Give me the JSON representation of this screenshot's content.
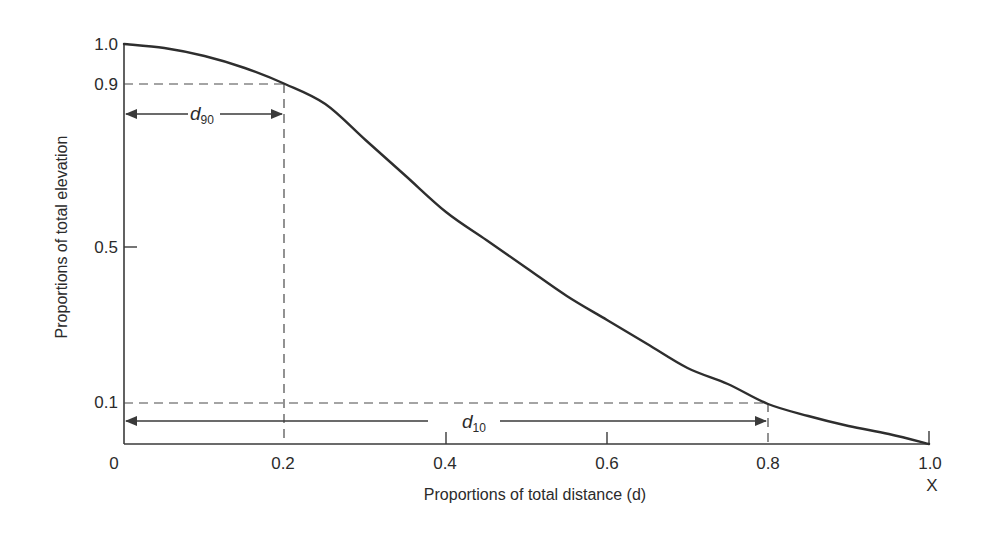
{
  "chart_data": {
    "type": "line",
    "title": "",
    "xlabel": "Proportions of total distance (d)",
    "ylabel": "Proportions of total elevation",
    "x_end_label": "X",
    "xlim": [
      0,
      1.0
    ],
    "ylim": [
      0,
      1.0
    ],
    "grid": false,
    "legend": "none",
    "x_ticks": [
      "0",
      "0.2",
      "0.4",
      "0.6",
      "0.8",
      "1.0"
    ],
    "y_ticks": [
      "1.0",
      "0.9",
      "0.5",
      "0.1"
    ],
    "series": [
      {
        "name": "hypsometric curve",
        "x": [
          0.0,
          0.05,
          0.1,
          0.15,
          0.2,
          0.25,
          0.3,
          0.35,
          0.4,
          0.45,
          0.5,
          0.55,
          0.6,
          0.65,
          0.7,
          0.75,
          0.8,
          0.85,
          0.9,
          0.95,
          1.0
        ],
        "y": [
          1.0,
          0.99,
          0.97,
          0.94,
          0.9,
          0.85,
          0.76,
          0.67,
          0.58,
          0.51,
          0.44,
          0.37,
          0.31,
          0.25,
          0.19,
          0.15,
          0.1,
          0.07,
          0.045,
          0.025,
          0.0
        ]
      }
    ],
    "annotations": [
      {
        "label": "d",
        "subscript": "90",
        "from_x": 0,
        "to_x": 0.2,
        "at_y": 0.9,
        "description": "distance at 90% elevation"
      },
      {
        "label": "d",
        "subscript": "10",
        "from_x": 0,
        "to_x": 0.8,
        "at_y": 0.1,
        "description": "distance at 10% elevation"
      }
    ]
  }
}
